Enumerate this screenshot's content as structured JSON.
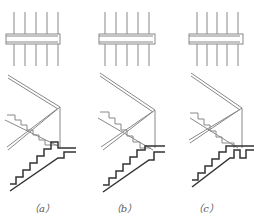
{
  "figure": {
    "panels": [
      {
        "id": "a",
        "label": "（a）",
        "offset_x": 0,
        "top_end": "closed-right",
        "bottom_detail": "notched-step"
      },
      {
        "id": "b",
        "label": "（b）",
        "offset_x": 85,
        "top_end": "closed-right",
        "bottom_detail": "notched-step"
      },
      {
        "id": "c",
        "label": "（c）",
        "offset_x": 166,
        "top_end": "closed-right",
        "bottom_detail": "deep-notch"
      }
    ],
    "colors": {
      "line": "#777777",
      "heavy": "#333333",
      "label": "#555555"
    }
  }
}
